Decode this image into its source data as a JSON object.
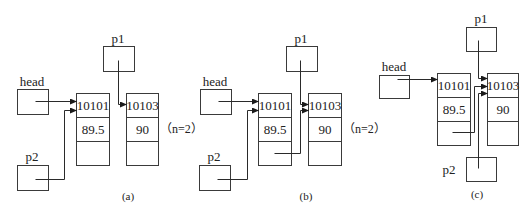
{
  "colors": {
    "stroke": "#3a3a3a",
    "text": "#222222",
    "background": "#ffffff"
  },
  "panels": [
    {
      "id": "a",
      "caption": "(a)",
      "caption_pos": [
        128,
        200
      ],
      "head": {
        "label": "head",
        "box": [
          17,
          89,
          31,
          25
        ],
        "label_pos": [
          32,
          86
        ]
      },
      "p1": {
        "label": "p1",
        "box": [
          103,
          46,
          31,
          25
        ],
        "label_pos": [
          118,
          43
        ]
      },
      "p2": {
        "label": "p2",
        "box": [
          17,
          165,
          31,
          25
        ],
        "label_pos": [
          32,
          161
        ]
      },
      "nodes": [
        {
          "x": 76,
          "y": 93,
          "w": 33,
          "row_h": 24,
          "num": "10101",
          "score": "89.5",
          "next": ""
        },
        {
          "x": 126,
          "y": 93,
          "w": 32,
          "row_h": 24,
          "num": "10103",
          "score": "90",
          "next": ""
        }
      ],
      "note": {
        "text": "（n=2）",
        "pos": [
          160,
          133
        ]
      },
      "wires": [
        {
          "from": "head",
          "points": [
            [
              35,
              101
            ],
            [
              76,
              101
            ]
          ],
          "arrow": true
        },
        {
          "from": "p1",
          "points": [
            [
              118,
              60
            ],
            [
              118,
              104
            ],
            [
              126,
              104
            ]
          ],
          "arrow": true
        },
        {
          "from": "p2",
          "points": [
            [
              35,
              179
            ],
            [
              64,
              179
            ],
            [
              64,
              110
            ],
            [
              76,
              110
            ]
          ],
          "arrow": true
        }
      ]
    },
    {
      "id": "b",
      "caption": "(b)",
      "caption_pos": [
        306,
        200
      ],
      "head": {
        "label": "head",
        "box": [
          200,
          89,
          31,
          25
        ],
        "label_pos": [
          215,
          86
        ]
      },
      "p1": {
        "label": "p1",
        "box": [
          286,
          46,
          31,
          25
        ],
        "label_pos": [
          301,
          43
        ]
      },
      "p2": {
        "label": "p2",
        "box": [
          199,
          165,
          31,
          25
        ],
        "label_pos": [
          214,
          161
        ]
      },
      "nodes": [
        {
          "x": 258,
          "y": 93,
          "w": 33,
          "row_h": 24,
          "num": "10101",
          "score": "89.5",
          "next": ""
        },
        {
          "x": 308,
          "y": 93,
          "w": 33,
          "row_h": 24,
          "num": "10103",
          "score": "90",
          "next": ""
        }
      ],
      "note": {
        "text": "（n=2）",
        "pos": [
          343,
          133
        ]
      },
      "wires": [
        {
          "from": "head",
          "points": [
            [
              218,
              101
            ],
            [
              258,
              101
            ]
          ],
          "arrow": true
        },
        {
          "from": "p1",
          "points": [
            [
              300,
              60
            ],
            [
              300,
              104
            ],
            [
              308,
              104
            ]
          ],
          "arrow": true
        },
        {
          "from": "p2",
          "points": [
            [
              217,
              179
            ],
            [
              247,
              179
            ],
            [
              247,
              110
            ],
            [
              258,
              110
            ]
          ],
          "arrow": true
        },
        {
          "from": "node1-next",
          "points": [
            [
              274,
              153
            ],
            [
              300,
              153
            ],
            [
              300,
              110
            ],
            [
              308,
              110
            ]
          ],
          "arrow": true
        }
      ]
    },
    {
      "id": "c",
      "caption": "(c)",
      "caption_pos": [
        477,
        198
      ],
      "head": {
        "label": "head",
        "box": [
          379,
          75,
          30,
          23
        ],
        "label_pos": [
          394,
          71
        ]
      },
      "p1": {
        "label": "p1",
        "box": [
          466,
          27,
          30,
          24
        ],
        "label_pos": [
          481,
          23
        ]
      },
      "p2": {
        "label": "p2",
        "box": [
          466,
          157,
          30,
          24
        ],
        "label_pos": [
          449,
          174
        ]
      },
      "nodes": [
        {
          "x": 437,
          "y": 73,
          "w": 33,
          "row_h": 24,
          "num": "10101",
          "score": "89.5",
          "next": ""
        },
        {
          "x": 487,
          "y": 73,
          "w": 31,
          "row_h": 24,
          "num": "10103",
          "score": "90",
          "next": ""
        }
      ],
      "note": null,
      "wires": [
        {
          "from": "head",
          "points": [
            [
              397,
              79
            ],
            [
              437,
              79
            ]
          ],
          "arrow": true
        },
        {
          "from": "p1",
          "points": [
            [
              478,
              40
            ],
            [
              478,
              78
            ],
            [
              487,
              78
            ]
          ],
          "arrow": true
        },
        {
          "from": "node1-next",
          "points": [
            [
              452,
              132
            ],
            [
              474,
              132
            ],
            [
              474,
              86
            ],
            [
              487,
              86
            ]
          ],
          "arrow": true
        },
        {
          "from": "p2",
          "points": [
            [
              478,
              168
            ],
            [
              478,
              93
            ],
            [
              487,
              93
            ]
          ],
          "arrow": true
        }
      ]
    }
  ]
}
